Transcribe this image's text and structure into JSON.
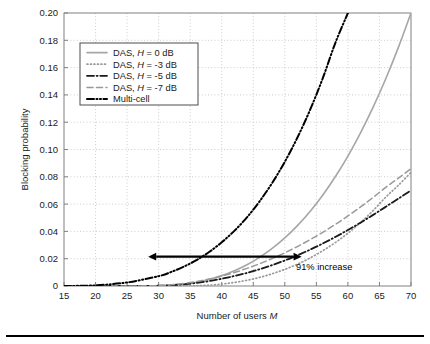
{
  "figure": {
    "background_color": "#ffffff",
    "plot_border_color": "#808080",
    "grid_color": "#bfbfbf",
    "footer_rule_color": "#000000"
  },
  "axis": {
    "y_title": "Blocking probability",
    "x_title_prefix": "Number of users ",
    "x_title_symbol": "M",
    "y_ticks": [
      "0",
      "0.02",
      "0.04",
      "0.06",
      "0.08",
      "0.10",
      "0.12",
      "0.14",
      "0.16",
      "0.18",
      "0.20"
    ],
    "x_ticks": [
      "15",
      "20",
      "25",
      "30",
      "35",
      "40",
      "45",
      "50",
      "55",
      "60",
      "65",
      "70"
    ]
  },
  "legend": {
    "entries": [
      {
        "label_prefix": "DAS, ",
        "label_symbol": "H",
        "label_suffix": " = 0 dB",
        "style": "solid",
        "color": "#a6a6a6"
      },
      {
        "label_prefix": "DAS, ",
        "label_symbol": "H",
        "label_suffix": " = -3 dB",
        "style": "dotted",
        "color": "#999999"
      },
      {
        "label_prefix": "DAS, ",
        "label_symbol": "H",
        "label_suffix": " = -5 dB",
        "style": "dashdot",
        "color": "#1a1a1a"
      },
      {
        "label_prefix": "DAS, ",
        "label_symbol": "H",
        "label_suffix": " = -7 dB",
        "style": "dashed",
        "color": "#999999"
      },
      {
        "label_prefix": "",
        "label_symbol": "",
        "label_suffix": "Multi-cell",
        "style": "dashdotdot",
        "color": "#000000"
      }
    ]
  },
  "annotation": {
    "text": "91% increase",
    "arrow_x_start": 28.5,
    "arrow_x_end": 52.5,
    "arrow_y": 0.0215,
    "color": "#000000"
  },
  "chart_data": {
    "type": "line",
    "title": "",
    "xlabel": "Number of users M",
    "ylabel": "Blocking probability",
    "xlim": [
      15,
      70
    ],
    "ylim": [
      0,
      0.2
    ],
    "xticks": [
      15,
      20,
      25,
      30,
      35,
      40,
      45,
      50,
      55,
      60,
      65,
      70
    ],
    "yticks": [
      0,
      0.02,
      0.04,
      0.06,
      0.08,
      0.1,
      0.12,
      0.14,
      0.16,
      0.18,
      0.2
    ],
    "grid": true,
    "legend_position": "upper-left",
    "x": [
      15,
      20,
      25,
      30,
      32,
      34,
      36,
      38,
      40,
      42,
      44,
      46,
      48,
      50,
      52,
      54,
      56,
      58,
      60,
      62,
      64,
      66,
      68,
      70
    ],
    "series": [
      {
        "name": "DAS, H = 0 dB",
        "style": "solid",
        "color": "#a6a6a6",
        "values": [
          0,
          0,
          0,
          0.0002,
          0.0006,
          0.0014,
          0.0028,
          0.0048,
          0.0076,
          0.0112,
          0.0156,
          0.021,
          0.0275,
          0.0352,
          0.0442,
          0.0546,
          0.0665,
          0.08,
          0.0952,
          0.1122,
          0.131,
          0.1518,
          0.1748,
          0.2
        ]
      },
      {
        "name": "DAS, H = -3 dB",
        "style": "dotted",
        "color": "#999999",
        "values": [
          0,
          0,
          0,
          0,
          0,
          0,
          0.0002,
          0.0006,
          0.0014,
          0.0026,
          0.0042,
          0.0063,
          0.009,
          0.0122,
          0.016,
          0.0205,
          0.0258,
          0.0318,
          0.0387,
          0.0465,
          0.0553,
          0.0651,
          0.0738,
          0.0832
        ]
      },
      {
        "name": "DAS, H = -5 dB",
        "style": "dashdot",
        "color": "#1a1a1a",
        "values": [
          0,
          0,
          0,
          0.0002,
          0.0006,
          0.0013,
          0.0023,
          0.0036,
          0.0053,
          0.0073,
          0.0096,
          0.0123,
          0.0153,
          0.0187,
          0.0225,
          0.0266,
          0.0311,
          0.0359,
          0.041,
          0.0464,
          0.0521,
          0.058,
          0.064,
          0.07
        ]
      },
      {
        "name": "DAS, H = -7 dB",
        "style": "dashed",
        "color": "#999999",
        "values": [
          0,
          0,
          0,
          0.0003,
          0.0009,
          0.0019,
          0.0033,
          0.0051,
          0.0073,
          0.0099,
          0.0129,
          0.0163,
          0.0201,
          0.0243,
          0.0289,
          0.0339,
          0.0393,
          0.0451,
          0.0513,
          0.0579,
          0.0649,
          0.0723,
          0.079,
          0.086
        ]
      },
      {
        "name": "Multi-cell",
        "style": "dashdotdot",
        "color": "#000000",
        "values": [
          0,
          0.0005,
          0.0026,
          0.0072,
          0.0103,
          0.0142,
          0.019,
          0.0249,
          0.032,
          0.0404,
          0.0503,
          0.062,
          0.0755,
          0.091,
          0.1088,
          0.129,
          0.152,
          0.178,
          0.2,
          null,
          null,
          null,
          null,
          null
        ]
      }
    ]
  }
}
